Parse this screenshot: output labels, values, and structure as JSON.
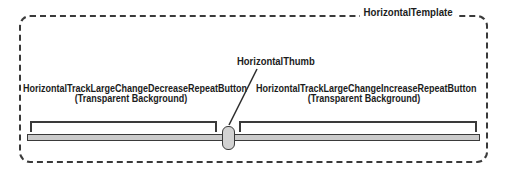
{
  "diagram": {
    "template": {
      "label": "HorizontalTemplate"
    },
    "thumb": {
      "label": "HorizontalThumb"
    },
    "decrease_button": {
      "label": "HorizontalTrackLargeChangeDecreaseRepeatButton",
      "sub_label": "(Transparent Background)"
    },
    "increase_button": {
      "label": "HorizontalTrackLargeChangeIncreaseRepeatButton",
      "sub_label": "(Transparent Background)"
    },
    "colors": {
      "outline": "#3a3a3a",
      "text": "#1c1c1c",
      "track_fill": "#cbcbcb",
      "thumb_fill": "#d2d2d2",
      "background": "#ffffff"
    }
  }
}
